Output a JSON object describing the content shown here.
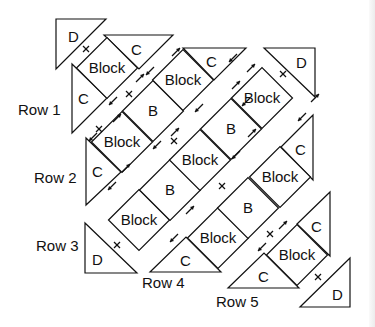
{
  "diagram": {
    "row_labels": [
      {
        "text": "Row 1",
        "x": 18,
        "y": 115
      },
      {
        "text": "Row 2",
        "x": 34,
        "y": 183
      },
      {
        "text": "Row 3",
        "x": 36,
        "y": 251
      },
      {
        "text": "Row 4",
        "x": 142,
        "y": 288
      },
      {
        "text": "Row 5",
        "x": 216,
        "y": 307
      }
    ],
    "diamond_half": 30.5,
    "diamonds": [
      {
        "row": 1,
        "label": "Block",
        "cx": 107,
        "cy": 68
      },
      {
        "row": 2,
        "label": "Block",
        "cx": 122,
        "cy": 142
      },
      {
        "row": 2,
        "label": "B",
        "cx": 153,
        "cy": 111
      },
      {
        "row": 2,
        "label": "Block",
        "cx": 183,
        "cy": 80
      },
      {
        "row": 3,
        "label": "Block",
        "cx": 139,
        "cy": 220
      },
      {
        "row": 3,
        "label": "B",
        "cx": 170,
        "cy": 190
      },
      {
        "row": 3,
        "label": "Block",
        "cx": 200,
        "cy": 160
      },
      {
        "row": 3,
        "label": "B",
        "cx": 231,
        "cy": 129
      },
      {
        "row": 3,
        "label": "Block",
        "cx": 262,
        "cy": 98
      },
      {
        "row": 4,
        "label": "Block",
        "cx": 218,
        "cy": 238
      },
      {
        "row": 4,
        "label": "B",
        "cx": 248,
        "cy": 208
      },
      {
        "row": 4,
        "label": "Block",
        "cx": 280,
        "cy": 177
      },
      {
        "row": 5,
        "label": "Block",
        "cx": 297,
        "cy": 255
      }
    ],
    "triangles": [
      {
        "row": 1,
        "label": "D",
        "points": "56,19 106,19 56,69",
        "lx": 68,
        "ly": 42
      },
      {
        "row": 1,
        "label": "C",
        "points": "72,64 72,133 107,98",
        "lx": 78,
        "ly": 104
      },
      {
        "row": 1,
        "label": "C",
        "points": "104,35 173,35 139,69",
        "lx": 131,
        "ly": 55
      },
      {
        "row": 2,
        "label": "C",
        "points": "86,138 86,205 121,172",
        "lx": 92,
        "ly": 177
      },
      {
        "row": 2,
        "label": "C",
        "points": "183,48 246,48 214,80",
        "lx": 206,
        "ly": 67
      },
      {
        "row": 3,
        "label": "D",
        "points": "85,223 85,273 137,273",
        "lx": 92,
        "ly": 265
      },
      {
        "row": 3,
        "label": "D",
        "points": "264,48 315,48 315,97",
        "lx": 296,
        "ly": 68
      },
      {
        "row": 4,
        "label": "C",
        "points": "150,272 221,272 186,237",
        "lx": 180,
        "ly": 266
      },
      {
        "row": 4,
        "label": "C",
        "points": "281,147 313,115 313,180",
        "lx": 295,
        "ly": 155
      },
      {
        "row": 5,
        "label": "C",
        "points": "228,288 299,288 264,253",
        "lx": 258,
        "ly": 282
      },
      {
        "row": 5,
        "label": "C",
        "points": "297,224 330,192 330,256",
        "lx": 311,
        "ly": 232
      },
      {
        "row": 5,
        "label": "D",
        "points": "300,307 350,307 350,258",
        "lx": 332,
        "ly": 300
      }
    ],
    "crosses": [
      {
        "x": 86,
        "y": 49
      },
      {
        "x": 129,
        "y": 94
      },
      {
        "x": 174,
        "y": 141
      },
      {
        "x": 222,
        "y": 186
      },
      {
        "x": 117,
        "y": 245
      },
      {
        "x": 283,
        "y": 74
      },
      {
        "x": 270,
        "y": 234
      },
      {
        "x": 318,
        "y": 277
      },
      {
        "x": 99,
        "y": 129
      }
    ],
    "arrows": [
      {
        "x": 117,
        "y": 118,
        "dir": "ne"
      },
      {
        "x": 140,
        "y": 78,
        "dir": "ne"
      },
      {
        "x": 176,
        "y": 52,
        "dir": "ne"
      },
      {
        "x": 113,
        "y": 101,
        "dir": "sw"
      },
      {
        "x": 150,
        "y": 71,
        "dir": "sw"
      },
      {
        "x": 93,
        "y": 137,
        "dir": "sw"
      },
      {
        "x": 233,
        "y": 58,
        "dir": "sw"
      },
      {
        "x": 251,
        "y": 68,
        "dir": "ne"
      },
      {
        "x": 112,
        "y": 186,
        "dir": "sw"
      },
      {
        "x": 126,
        "y": 168,
        "dir": "ne"
      },
      {
        "x": 157,
        "y": 145,
        "dir": "sw"
      },
      {
        "x": 175,
        "y": 132,
        "dir": "ne"
      },
      {
        "x": 199,
        "y": 108,
        "dir": "sw"
      },
      {
        "x": 246,
        "y": 102,
        "dir": "sw"
      },
      {
        "x": 236,
        "y": 85,
        "dir": "ne"
      },
      {
        "x": 190,
        "y": 210,
        "dir": "ne"
      },
      {
        "x": 174,
        "y": 238,
        "dir": "sw"
      },
      {
        "x": 236,
        "y": 155,
        "dir": "sw"
      },
      {
        "x": 252,
        "y": 133,
        "dir": "ne"
      },
      {
        "x": 262,
        "y": 247,
        "dir": "sw"
      },
      {
        "x": 283,
        "y": 225,
        "dir": "ne"
      },
      {
        "x": 302,
        "y": 117,
        "dir": "sw"
      },
      {
        "x": 315,
        "y": 98,
        "dir": "ne"
      }
    ],
    "colors": {
      "stroke": "#111111",
      "fill": "#ffffff",
      "edge": "#ececec"
    }
  }
}
